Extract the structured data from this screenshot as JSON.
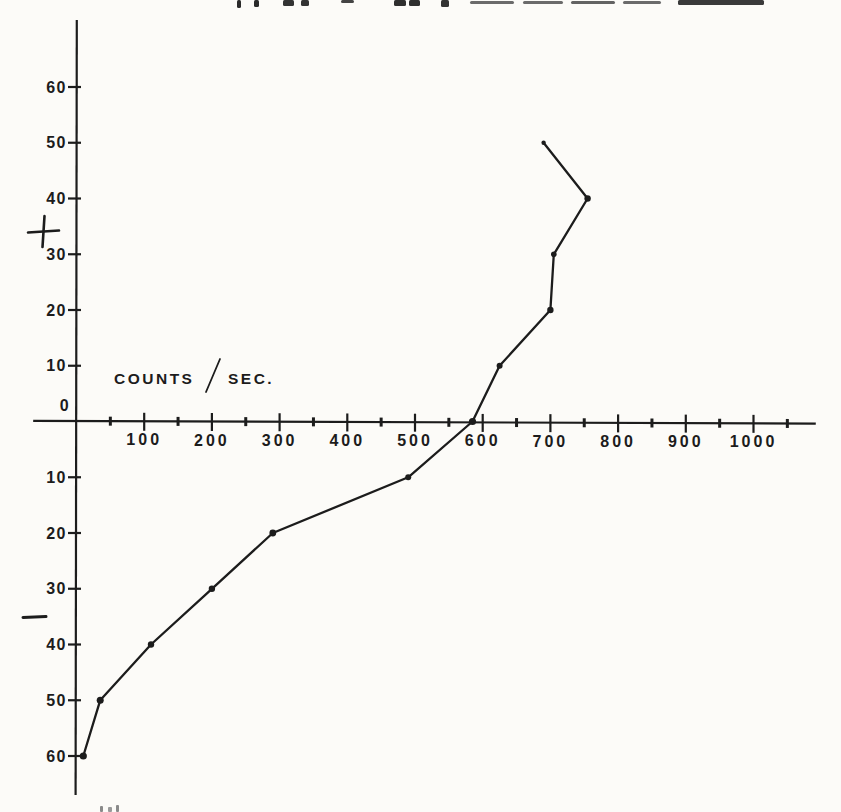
{
  "figure": {
    "background": "#fcfbf8",
    "ink_color": "#1c1c1c",
    "top_edge_fragment": "illegible cropped line of text from page above (only descender/underline fragments visible)",
    "bottom_edge_fragment": "illegible cropped caption fragment at bottom edge"
  },
  "chart_data": {
    "type": "line",
    "title": "",
    "xlabel": "COUNTS / SEC.",
    "ylabel": "",
    "y_positive_symbol": "+",
    "y_negative_symbol": "−",
    "origin_label": "0",
    "grid": false,
    "legend": null,
    "xlim": [
      -64,
      1092
    ],
    "ylim": [
      -67,
      72
    ],
    "x_major_ticks": [
      100,
      200,
      300,
      400,
      500,
      600,
      700,
      800,
      900,
      1000
    ],
    "x_minor_ticks": [
      50,
      150,
      250,
      350,
      450,
      550,
      650,
      750,
      850,
      950,
      1050
    ],
    "y_tick_values": [
      60,
      50,
      40,
      30,
      20,
      10,
      -10,
      -20,
      -30,
      -40,
      -50,
      -60
    ],
    "y_tick_labels": [
      "60",
      "50",
      "40",
      "30",
      "20",
      "10",
      "10",
      "20",
      "30",
      "40",
      "50",
      "60"
    ],
    "series": [
      {
        "name": "deflection vs counting rate",
        "marker": "dot",
        "points": [
          {
            "counts": 10,
            "deflection": -60,
            "r": 3.6
          },
          {
            "counts": 35,
            "deflection": -50,
            "r": 3.5
          },
          {
            "counts": 110,
            "deflection": -40,
            "r": 3.2
          },
          {
            "counts": 200,
            "deflection": -30,
            "r": 3.2
          },
          {
            "counts": 290,
            "deflection": -20,
            "r": 3.4
          },
          {
            "counts": 490,
            "deflection": -10,
            "r": 3.0
          },
          {
            "counts": 585,
            "deflection": 0,
            "r": 3.6
          },
          {
            "counts": 625,
            "deflection": 10,
            "r": 3.0
          },
          {
            "counts": 700,
            "deflection": 20,
            "r": 3.2
          },
          {
            "counts": 705,
            "deflection": 30,
            "r": 2.8
          },
          {
            "counts": 755,
            "deflection": 40,
            "r": 3.2
          },
          {
            "counts": 690,
            "deflection": 50,
            "r": 2.2
          }
        ]
      }
    ]
  }
}
